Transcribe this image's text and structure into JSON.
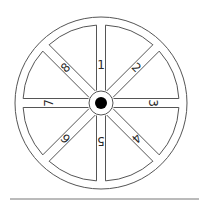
{
  "wheel": {
    "center": [
      101,
      103
    ],
    "outer_radius": 86,
    "rim_inner_radius": 78,
    "hub_radius": 12,
    "axle_radius": 6,
    "spoke_half_width": 4.5,
    "stroke_color": "#555555",
    "axle_color": "#000000",
    "spokes": [
      {
        "label": "1",
        "angle": 0
      },
      {
        "label": "2",
        "angle": 45
      },
      {
        "label": "3",
        "angle": 90
      },
      {
        "label": "4",
        "angle": 135
      },
      {
        "label": "5",
        "angle": 180
      },
      {
        "label": "6",
        "angle": 225
      },
      {
        "label": "7",
        "angle": 270
      },
      {
        "label": "8",
        "angle": 315
      }
    ]
  },
  "baseline": {
    "y": 199,
    "x1": 10,
    "x2": 199,
    "color": "#777777"
  }
}
